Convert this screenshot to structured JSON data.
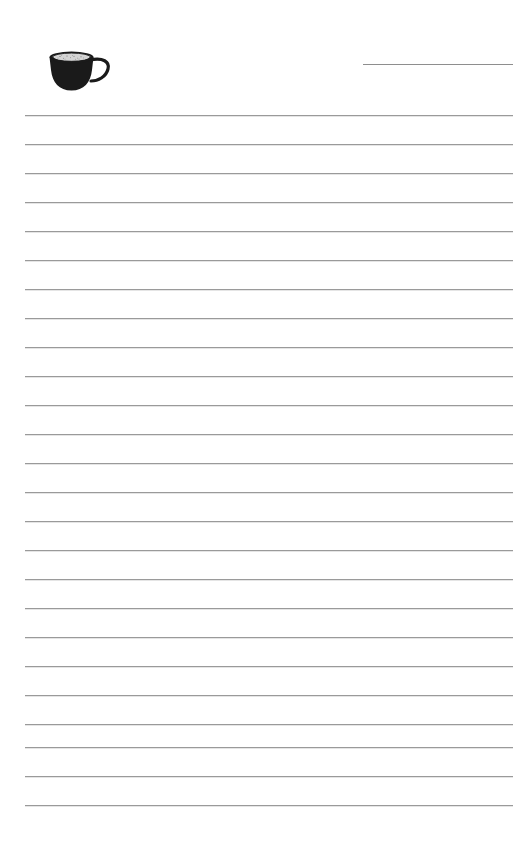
{
  "page": {
    "kind": "lined-notepad-page",
    "width": 523,
    "height": 851,
    "background_color": "#ffffff",
    "paper_label": "",
    "rule_color": "#9a9a9a",
    "ink_color": "#1a1a1a"
  },
  "header": {
    "title_text": "",
    "title_rule": {
      "present": true,
      "x": 363,
      "y": 64,
      "width": 150,
      "color": "#8e8e8e"
    },
    "illustration": {
      "icon_name": "coffee-cup-icon",
      "description": "filled black coffee cup with handle on right and light speckled coffee surface",
      "x": 46,
      "y": 48,
      "width": 70,
      "height": 46,
      "body_color": "#1a1a1a",
      "surface_color": "#d8d8d8"
    }
  },
  "body": {
    "writing_area_text": "",
    "rules": {
      "count": 24,
      "first_y": 115,
      "spacing": 29,
      "left": 25,
      "right": 513,
      "width": 488
    },
    "lines": [
      {
        "index": 1,
        "y": 115,
        "text": ""
      },
      {
        "index": 2,
        "y": 144,
        "text": ""
      },
      {
        "index": 3,
        "y": 173,
        "text": ""
      },
      {
        "index": 4,
        "y": 202,
        "text": ""
      },
      {
        "index": 5,
        "y": 231,
        "text": ""
      },
      {
        "index": 6,
        "y": 260,
        "text": ""
      },
      {
        "index": 7,
        "y": 289,
        "text": ""
      },
      {
        "index": 8,
        "y": 318,
        "text": ""
      },
      {
        "index": 9,
        "y": 347,
        "text": ""
      },
      {
        "index": 10,
        "y": 376,
        "text": ""
      },
      {
        "index": 11,
        "y": 405,
        "text": ""
      },
      {
        "index": 12,
        "y": 434,
        "text": ""
      },
      {
        "index": 13,
        "y": 463,
        "text": ""
      },
      {
        "index": 14,
        "y": 492,
        "text": ""
      },
      {
        "index": 15,
        "y": 521,
        "text": ""
      },
      {
        "index": 16,
        "y": 550,
        "text": ""
      },
      {
        "index": 17,
        "y": 579,
        "text": ""
      },
      {
        "index": 18,
        "y": 608,
        "text": ""
      },
      {
        "index": 19,
        "y": 637,
        "text": ""
      },
      {
        "index": 20,
        "y": 666,
        "text": ""
      },
      {
        "index": 21,
        "y": 695,
        "text": ""
      },
      {
        "index": 22,
        "y": 724,
        "text": ""
      },
      {
        "index": 23,
        "y": 747,
        "text": ""
      },
      {
        "index": 24,
        "y": 776,
        "text": ""
      },
      {
        "index": 25,
        "y": 805,
        "text": ""
      }
    ]
  },
  "footer": {
    "text": ""
  }
}
